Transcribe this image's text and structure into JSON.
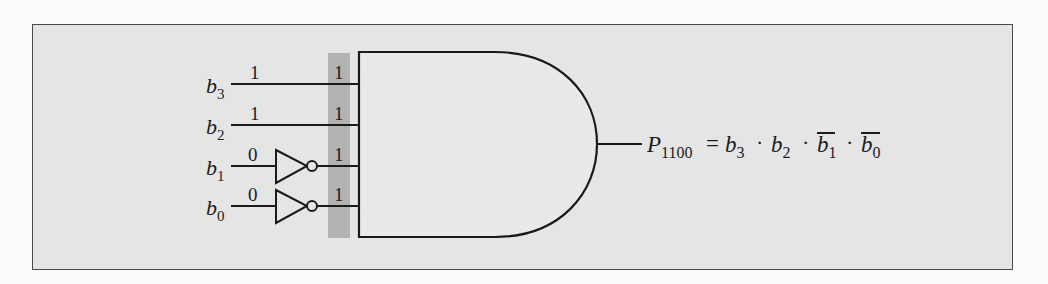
{
  "figure": {
    "inputs": [
      {
        "name": "b",
        "sub": "3",
        "input_value": "1",
        "gate_value": "1",
        "inverted": false
      },
      {
        "name": "b",
        "sub": "2",
        "input_value": "1",
        "gate_value": "1",
        "inverted": false
      },
      {
        "name": "b",
        "sub": "1",
        "input_value": "0",
        "gate_value": "1",
        "inverted": true
      },
      {
        "name": "b",
        "sub": "0",
        "input_value": "0",
        "gate_value": "1",
        "inverted": true
      }
    ],
    "output": {
      "name": "P",
      "sub": "1100",
      "equals": "=",
      "terms": [
        {
          "name": "b",
          "sub": "3",
          "overline": false
        },
        {
          "name": "b",
          "sub": "2",
          "overline": false
        },
        {
          "name": "b",
          "sub": "1",
          "overline": true
        },
        {
          "name": "b",
          "sub": "0",
          "overline": true
        }
      ],
      "operator": "·"
    },
    "colors": {
      "frame_bg": "#e5e5e5",
      "highlight_strip": "#b3b3b3",
      "ink": "#1a1a1a"
    }
  }
}
